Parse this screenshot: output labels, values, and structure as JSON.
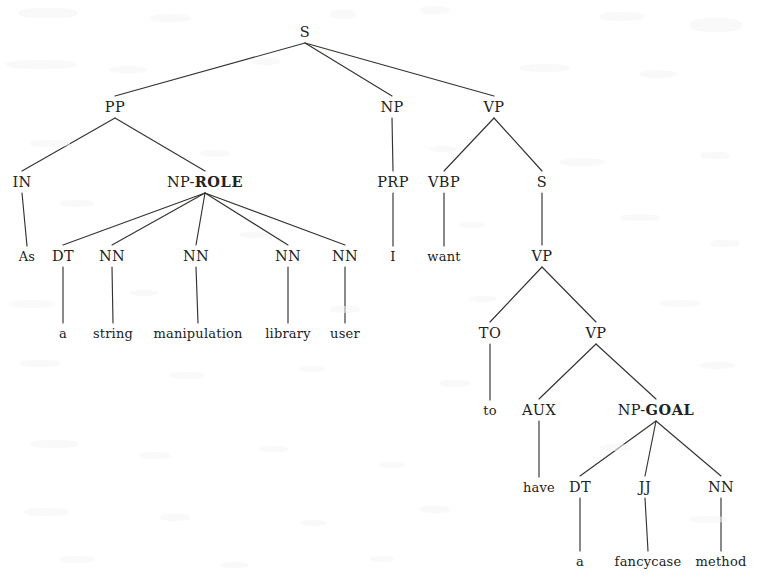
{
  "figure": {
    "kind": "constituency-parse-tree",
    "sentence": "As a string manipulation library user I want to have a fancycase method",
    "background_color": "#ffffff",
    "ink_color": "#222222"
  },
  "nodes": [
    {
      "id": "s-root",
      "label": "S",
      "bold": "",
      "x": 305,
      "y": 32,
      "type": "nonterminal"
    },
    {
      "id": "pp",
      "label": "PP",
      "bold": "",
      "x": 115,
      "y": 107,
      "type": "nonterminal"
    },
    {
      "id": "np-subj",
      "label": "NP",
      "bold": "",
      "x": 392,
      "y": 107,
      "type": "nonterminal"
    },
    {
      "id": "vp-main",
      "label": "VP",
      "bold": "",
      "x": 494,
      "y": 107,
      "type": "nonterminal"
    },
    {
      "id": "in",
      "label": "IN",
      "bold": "",
      "x": 22,
      "y": 182,
      "type": "preterminal"
    },
    {
      "id": "np-role",
      "label": "NP-",
      "bold": "ROLE",
      "x": 205,
      "y": 182,
      "type": "nonterminal"
    },
    {
      "id": "prp",
      "label": "PRP",
      "bold": "",
      "x": 393,
      "y": 182,
      "type": "preterminal"
    },
    {
      "id": "vbp",
      "label": "VBP",
      "bold": "",
      "x": 444,
      "y": 182,
      "type": "preterminal"
    },
    {
      "id": "s-embedded",
      "label": "S",
      "bold": "",
      "x": 542,
      "y": 182,
      "type": "nonterminal"
    },
    {
      "id": "leaf-as",
      "label": "As",
      "bold": "",
      "x": 27,
      "y": 256,
      "type": "leaf"
    },
    {
      "id": "dt1",
      "label": "DT",
      "bold": "",
      "x": 63,
      "y": 256,
      "type": "preterminal"
    },
    {
      "id": "nn1",
      "label": "NN",
      "bold": "",
      "x": 112,
      "y": 256,
      "type": "preterminal"
    },
    {
      "id": "nn2",
      "label": "NN",
      "bold": "",
      "x": 196,
      "y": 256,
      "type": "preterminal"
    },
    {
      "id": "nn3",
      "label": "NN",
      "bold": "",
      "x": 288,
      "y": 256,
      "type": "preterminal"
    },
    {
      "id": "nn4",
      "label": "NN",
      "bold": "",
      "x": 345,
      "y": 256,
      "type": "preterminal"
    },
    {
      "id": "leaf-i",
      "label": "I",
      "bold": "",
      "x": 393,
      "y": 256,
      "type": "leaf"
    },
    {
      "id": "leaf-want",
      "label": "want",
      "bold": "",
      "x": 444,
      "y": 256,
      "type": "leaf"
    },
    {
      "id": "vp-inner",
      "label": "VP",
      "bold": "",
      "x": 542,
      "y": 256,
      "type": "nonterminal"
    },
    {
      "id": "leaf-a1",
      "label": "a",
      "bold": "",
      "x": 63,
      "y": 333,
      "type": "leaf"
    },
    {
      "id": "leaf-string",
      "label": "string",
      "bold": "",
      "x": 113,
      "y": 333,
      "type": "leaf"
    },
    {
      "id": "leaf-manip",
      "label": "manipulation",
      "bold": "",
      "x": 198,
      "y": 333,
      "type": "leaf"
    },
    {
      "id": "leaf-library",
      "label": "library",
      "bold": "",
      "x": 288,
      "y": 333,
      "type": "leaf"
    },
    {
      "id": "leaf-user",
      "label": "user",
      "bold": "",
      "x": 345,
      "y": 333,
      "type": "leaf"
    },
    {
      "id": "to",
      "label": "TO",
      "bold": "",
      "x": 490,
      "y": 333,
      "type": "preterminal"
    },
    {
      "id": "vp-deep",
      "label": "VP",
      "bold": "",
      "x": 596,
      "y": 333,
      "type": "nonterminal"
    },
    {
      "id": "leaf-to",
      "label": "to",
      "bold": "",
      "x": 490,
      "y": 410,
      "type": "leaf"
    },
    {
      "id": "aux",
      "label": "AUX",
      "bold": "",
      "x": 539,
      "y": 410,
      "type": "preterminal"
    },
    {
      "id": "np-goal",
      "label": "NP-",
      "bold": "GOAL",
      "x": 656,
      "y": 410,
      "type": "nonterminal"
    },
    {
      "id": "leaf-have",
      "label": "have",
      "bold": "",
      "x": 539,
      "y": 487,
      "type": "leaf"
    },
    {
      "id": "dt2",
      "label": "DT",
      "bold": "",
      "x": 580,
      "y": 487,
      "type": "preterminal"
    },
    {
      "id": "jj",
      "label": "JJ",
      "bold": "",
      "x": 645,
      "y": 487,
      "type": "preterminal"
    },
    {
      "id": "nn5",
      "label": "NN",
      "bold": "",
      "x": 721,
      "y": 487,
      "type": "preterminal"
    },
    {
      "id": "leaf-a2",
      "label": "a",
      "bold": "",
      "x": 580,
      "y": 561,
      "type": "leaf"
    },
    {
      "id": "leaf-fancycase",
      "label": "fancycase",
      "bold": "",
      "x": 648,
      "y": 561,
      "type": "leaf"
    },
    {
      "id": "leaf-method",
      "label": "method",
      "bold": "",
      "x": 721,
      "y": 561,
      "type": "leaf"
    }
  ],
  "edges": [
    {
      "from": "s-root",
      "to": "pp"
    },
    {
      "from": "s-root",
      "to": "np-subj"
    },
    {
      "from": "s-root",
      "to": "vp-main"
    },
    {
      "from": "pp",
      "to": "in"
    },
    {
      "from": "pp",
      "to": "np-role"
    },
    {
      "from": "in",
      "to": "leaf-as"
    },
    {
      "from": "np-role",
      "to": "dt1"
    },
    {
      "from": "np-role",
      "to": "nn1"
    },
    {
      "from": "np-role",
      "to": "nn2"
    },
    {
      "from": "np-role",
      "to": "nn3"
    },
    {
      "from": "np-role",
      "to": "nn4"
    },
    {
      "from": "dt1",
      "to": "leaf-a1"
    },
    {
      "from": "nn1",
      "to": "leaf-string"
    },
    {
      "from": "nn2",
      "to": "leaf-manip"
    },
    {
      "from": "nn3",
      "to": "leaf-library"
    },
    {
      "from": "nn4",
      "to": "leaf-user"
    },
    {
      "from": "np-subj",
      "to": "prp"
    },
    {
      "from": "prp",
      "to": "leaf-i"
    },
    {
      "from": "vp-main",
      "to": "vbp"
    },
    {
      "from": "vp-main",
      "to": "s-embedded"
    },
    {
      "from": "vbp",
      "to": "leaf-want"
    },
    {
      "from": "s-embedded",
      "to": "vp-inner"
    },
    {
      "from": "vp-inner",
      "to": "to"
    },
    {
      "from": "vp-inner",
      "to": "vp-deep"
    },
    {
      "from": "to",
      "to": "leaf-to"
    },
    {
      "from": "vp-deep",
      "to": "aux"
    },
    {
      "from": "vp-deep",
      "to": "np-goal"
    },
    {
      "from": "aux",
      "to": "leaf-have"
    },
    {
      "from": "np-goal",
      "to": "dt2"
    },
    {
      "from": "np-goal",
      "to": "jj"
    },
    {
      "from": "np-goal",
      "to": "nn5"
    },
    {
      "from": "dt2",
      "to": "leaf-a2"
    },
    {
      "from": "jj",
      "to": "leaf-fancycase"
    },
    {
      "from": "nn5",
      "to": "leaf-method"
    }
  ]
}
